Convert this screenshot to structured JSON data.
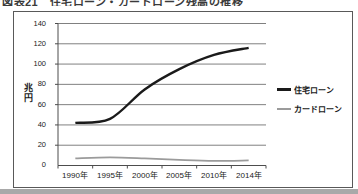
{
  "page": {
    "title_partially_clipped": "図表21　住宅ローン・カードローン残高の推移"
  },
  "chart_data": {
    "type": "line",
    "categories": [
      "1990年",
      "1995年",
      "2000年",
      "2005年",
      "2010年",
      "2014年"
    ],
    "series": [
      {
        "name": "住宅ローン",
        "values": [
          42,
          46,
          75,
          95,
          109,
          116
        ],
        "color": "#1a1a1a"
      },
      {
        "name": "カードローン",
        "values": [
          7,
          8,
          7,
          5.5,
          4.5,
          5
        ],
        "color": "#9b9b9b"
      }
    ],
    "title": "",
    "xlabel": "",
    "ylabel": "兆円",
    "ylim": [
      0,
      140
    ],
    "ytick_step": 20,
    "ytick_labels": [
      "140",
      "120",
      "100",
      "80",
      "60",
      "40",
      "20",
      "0"
    ],
    "grid": true,
    "legend_position": "right-inside"
  },
  "colors": {
    "gridline": "#808080",
    "axis": "#4d4d4d",
    "chart_border": "#595959",
    "text": "#1a1a1a",
    "bottom_band": "#a9a9a9"
  }
}
